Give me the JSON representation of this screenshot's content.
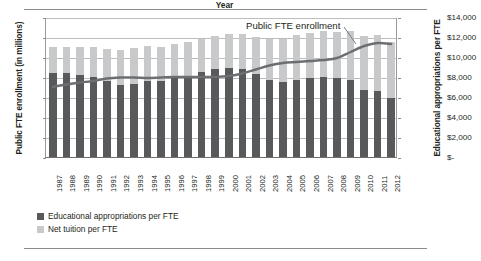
{
  "chart_data": {
    "type": "bar",
    "title": "",
    "subtitle": "",
    "xlabel": "Year",
    "ylabel": "Public FTE enrollment (in millions)",
    "y2label": "Educational appropriations per FTE",
    "grid": true,
    "legend_position": "bottom-left",
    "annotations": [
      {
        "text": "Public FTE enrollment",
        "target_year": "2009"
      }
    ],
    "ylim": [
      0,
      14
    ],
    "yticks": [
      "0",
      "2",
      "4",
      "6",
      "8",
      "10",
      "12",
      "14"
    ],
    "y2lim": [
      0,
      14000
    ],
    "y2ticks": [
      "$-",
      "$2,000",
      "$4,000",
      "$6,000",
      "$8,000",
      "$10,000",
      "$12,000",
      "$14,000"
    ],
    "categories": [
      "1987",
      "1988",
      "1989",
      "1990",
      "1991",
      "1992",
      "1993",
      "1994",
      "1995",
      "1996",
      "1997",
      "1998",
      "1999",
      "2000",
      "2001",
      "2002",
      "2003",
      "2004",
      "2005",
      "2006",
      "2007",
      "2008",
      "2009",
      "2010",
      "2011",
      "2012"
    ],
    "series": [
      {
        "name": "Educational appropriations per FTE",
        "type": "bar-stacked",
        "color": "#58595b",
        "unit": "dollars per FTE",
        "values": [
          8450,
          8450,
          8250,
          8050,
          7600,
          7250,
          7350,
          7650,
          7650,
          7950,
          8150,
          8500,
          8800,
          8900,
          8850,
          8300,
          7700,
          7500,
          7700,
          7900,
          8050,
          7900,
          7750,
          6700,
          6650,
          5900
        ]
      },
      {
        "name": "Net tuition per FTE",
        "type": "bar-stacked",
        "color": "#c8c9cb",
        "unit": "dollars per FTE",
        "values": [
          2550,
          2600,
          2750,
          2950,
          3200,
          3500,
          3600,
          3450,
          3400,
          3400,
          3400,
          3350,
          3350,
          3400,
          3500,
          3700,
          4100,
          4350,
          4500,
          4500,
          4600,
          4650,
          4850,
          5400,
          5600,
          5600
        ]
      },
      {
        "name": "Public FTE enrollment",
        "type": "line",
        "color": "#6d6e71",
        "unit": "millions",
        "axis": "left",
        "values": [
          7.1,
          7.35,
          7.55,
          7.7,
          7.95,
          8.05,
          8.05,
          8.0,
          8.05,
          8.1,
          8.1,
          8.1,
          8.1,
          8.2,
          8.45,
          8.85,
          9.25,
          9.5,
          9.6,
          9.7,
          9.8,
          10.0,
          10.6,
          11.2,
          11.5,
          11.4
        ]
      }
    ]
  },
  "legend": [
    {
      "label": "Educational appropriations per FTE",
      "color": "#58595b"
    },
    {
      "label": "Net tuition per FTE",
      "color": "#c8c9cb"
    }
  ]
}
